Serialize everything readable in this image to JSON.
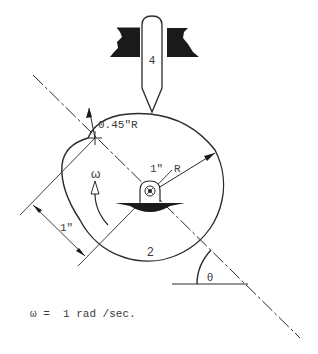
{
  "diagram": {
    "type": "cam-follower mechanism",
    "labels": {
      "follower_number": "4",
      "cam_number": "2",
      "nose_radius": "0.45\"R",
      "base_radius_value": "1\"",
      "base_radius_unit": "R",
      "offset_dimension": "1\"",
      "omega_symbol": "ω",
      "theta_symbol": "θ",
      "angular_velocity": "ω =  1 rad /sec."
    },
    "colors": {
      "line": "#2a2a2a",
      "fill": "#1a1a1a",
      "background": "#ffffff"
    }
  }
}
